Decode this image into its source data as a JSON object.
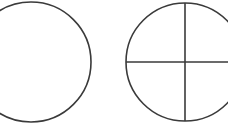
{
  "diagram": {
    "stroke_color": "#3a3a3a",
    "background": "#ffffff",
    "shapes": [
      {
        "id": "plain-circle",
        "type": "circle",
        "cx": 31,
        "cy": 62,
        "r": 60,
        "divided": false
      },
      {
        "id": "quartered-circle",
        "type": "circle",
        "cx": 185,
        "cy": 62,
        "r": 59,
        "divided": true
      }
    ]
  }
}
